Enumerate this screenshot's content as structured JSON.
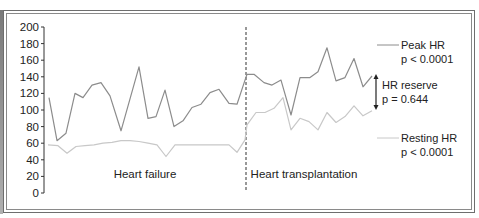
{
  "chart_data": {
    "type": "line",
    "title": "",
    "xlabel": "",
    "ylabel": "",
    "ylim": [
      0,
      200
    ],
    "yticks": [
      0,
      20,
      40,
      60,
      80,
      100,
      120,
      140,
      160,
      180,
      200
    ],
    "grid": false,
    "regions": [
      {
        "label": "Heart failure",
        "x_range": [
          0,
          22
        ]
      },
      {
        "label": "Heart transplantation",
        "x_range": [
          23,
          37
        ]
      }
    ],
    "divider_after_index": 22,
    "series": [
      {
        "name": "Peak HR",
        "stat": "p < 0.0001",
        "color": "#8c8c8c",
        "x": [
          49,
          57,
          66,
          75,
          83,
          92,
          101,
          110,
          121,
          139,
          148,
          156,
          165,
          174,
          183,
          192,
          201,
          210,
          219,
          229,
          237,
          245,
          247,
          254,
          264,
          272,
          281,
          291,
          300,
          310,
          318,
          327,
          336,
          345,
          354,
          363,
          372
        ],
        "values": [
          115,
          63,
          72,
          120,
          115,
          130,
          133,
          117,
          75,
          152,
          90,
          92,
          124,
          80,
          87,
          103,
          107,
          121,
          125,
          108,
          107,
          136,
          143,
          143,
          133,
          130,
          136,
          94,
          139,
          139,
          146,
          175,
          135,
          139,
          162,
          128,
          141
        ]
      },
      {
        "name": "Resting HR",
        "stat": "p < 0.0001",
        "color": "#c8c8c8",
        "x": [
          48,
          58,
          67,
          76,
          85,
          94,
          103,
          112,
          121,
          130,
          139,
          148,
          157,
          166,
          175,
          184,
          193,
          202,
          211,
          220,
          229,
          237,
          245,
          247,
          256,
          265,
          274,
          283,
          291,
          300,
          309,
          318,
          327,
          336,
          345,
          354,
          363,
          372
        ],
        "values": [
          58,
          57,
          48,
          56,
          57,
          58,
          60,
          61,
          63,
          63,
          62,
          60,
          58,
          44,
          58,
          58,
          58,
          58,
          58,
          58,
          58,
          49,
          64,
          82,
          97,
          97,
          102,
          115,
          76,
          90,
          86,
          76,
          97,
          85,
          92,
          105,
          93,
          99
        ]
      }
    ],
    "annotations": [
      {
        "label": "Peak HR",
        "sub": "p < 0.0001"
      },
      {
        "label": "HR reserve",
        "sub": "p = 0.644"
      },
      {
        "label": "Resting HR",
        "sub": "p < 0.0001"
      }
    ]
  },
  "labels": {
    "region_failure": "Heart failure",
    "region_transplant": "Heart transplantation",
    "peak_name": "Peak HR",
    "peak_p": "p < 0.0001",
    "reserve_name": "HR reserve",
    "reserve_p": "p = 0.644",
    "resting_name": "Resting HR",
    "resting_p": "p < 0.0001"
  }
}
